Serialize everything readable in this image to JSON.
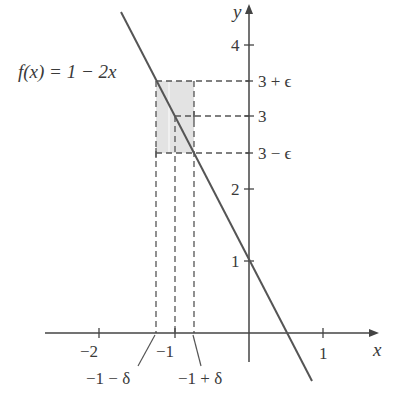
{
  "figure": {
    "function_label": "f(x) = 1 − 2x",
    "axes": {
      "x_label": "x",
      "y_label": "y",
      "x_ticks": [
        {
          "value": -2,
          "label": "−2"
        },
        {
          "value": -1,
          "label": "−1"
        },
        {
          "value": 1,
          "label": "1"
        }
      ],
      "y_ticks": [
        {
          "value": 1,
          "label": "1"
        },
        {
          "value": 2,
          "label": "2"
        },
        {
          "value": 4,
          "label": "4"
        }
      ]
    },
    "epsilon_labels": {
      "upper": "3 + ϵ",
      "center": "3",
      "lower": "3 − ϵ"
    },
    "delta_labels": {
      "left": "−1 − δ",
      "right": "−1 + δ"
    },
    "values": {
      "epsilon": 0.5,
      "delta": 0.25,
      "limit_point_x": -1,
      "limit_value_L": 3
    },
    "colors": {
      "line": "#555555",
      "axis": "#444444",
      "shade": "#e3e3e3",
      "dash": "#555555",
      "text": "#3a3a3a"
    }
  }
}
